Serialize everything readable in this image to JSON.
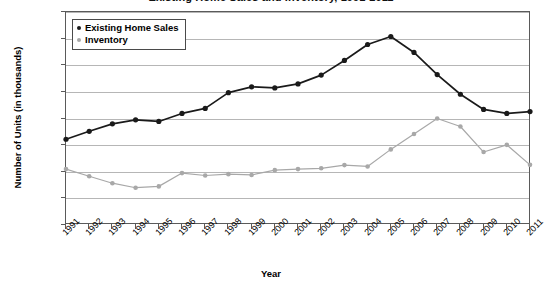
{
  "chart_data": {
    "type": "line",
    "title": "Existing Home Sales and Inventory, 1991-2011",
    "xlabel": "Year",
    "ylabel": "Number of Units (in thousands)",
    "x": [
      1991,
      1992,
      1993,
      1994,
      1995,
      1996,
      1997,
      1998,
      1999,
      2000,
      2001,
      2002,
      2003,
      2004,
      2005,
      2006,
      2007,
      2008,
      2009,
      2010,
      2011
    ],
    "categories": [
      "1991",
      "1992",
      "1993",
      "1994",
      "1995",
      "1996",
      "1997",
      "1998",
      "1999",
      "2000",
      "2001",
      "2002",
      "2003",
      "2004",
      "2005",
      "2006",
      "2007",
      "2008",
      "2009",
      "2010",
      "2011"
    ],
    "ylim": [
      0,
      8000
    ],
    "ytick_labels": [
      "0",
      "1000",
      "2000",
      "3000",
      "4000",
      "5000",
      "6000",
      "7000",
      "8000"
    ],
    "ytick_values": [
      0,
      1000,
      2000,
      3000,
      4000,
      5000,
      6000,
      7000,
      8000
    ],
    "grid": true,
    "legend_position": "top-left",
    "series": [
      {
        "name": "Existing Home Sales",
        "color": "#1a1a1a",
        "marker": "circle",
        "values": [
          3220,
          3520,
          3800,
          3950,
          3890,
          4190,
          4380,
          4970,
          5190,
          5150,
          5300,
          5630,
          6180,
          6780,
          7080,
          6480,
          5650,
          4910,
          4340,
          4190,
          4260
        ]
      },
      {
        "name": "Inventory",
        "color": "#a8a8a8",
        "marker": "circle",
        "values": [
          2100,
          1830,
          1570,
          1400,
          1450,
          1950,
          1860,
          1910,
          1880,
          2060,
          2100,
          2130,
          2250,
          2200,
          2840,
          3420,
          4000,
          3700,
          2740,
          3010,
          2260
        ]
      }
    ]
  },
  "legend": {
    "entries": [
      {
        "label": "Existing Home Sales",
        "color": "#1a1a1a"
      },
      {
        "label": "Inventory",
        "color": "#a8a8a8"
      }
    ]
  }
}
